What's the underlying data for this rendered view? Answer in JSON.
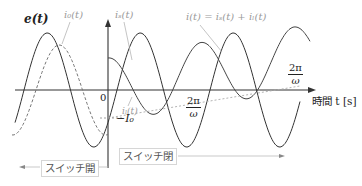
{
  "figure": {
    "type": "waveform-diagram",
    "axis": {
      "x_label": "時間 t [s]",
      "origin_label": "0",
      "tick_label_1": {
        "num": "2π",
        "den": "ω"
      },
      "tick_label_2": {
        "num": "2π",
        "den": "ω"
      },
      "I0_label": "−I₀"
    },
    "curves": {
      "e": {
        "label": "e(t)",
        "style": "solid",
        "color": "#333333"
      },
      "i0": {
        "label": "i₀(t)",
        "style": "dashed",
        "color": "#777777"
      },
      "is": {
        "label": "iₛ(t)",
        "style": "solid",
        "color": "#444444"
      },
      "il": {
        "label": "iₗ(t)",
        "style": "dotted",
        "color": "#aaaaaa"
      },
      "i": {
        "label": "i(t) = iₛ(t) + iₗ(t)",
        "style": "solid",
        "color": "#444444"
      }
    },
    "regions": {
      "left": {
        "label": "スイッチ開"
      },
      "right": {
        "label": "スイッチ閉"
      }
    }
  }
}
